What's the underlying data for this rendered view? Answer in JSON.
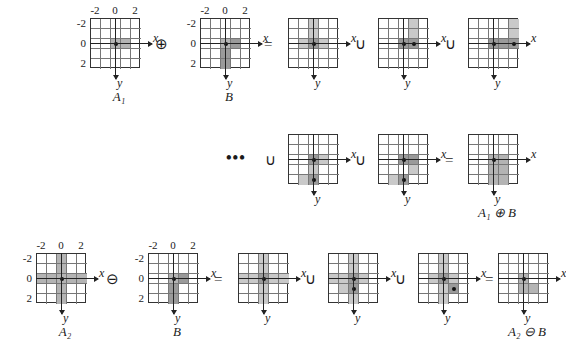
{
  "figure": {
    "axis_x_label": "x",
    "axis_y_label": "y",
    "tick_labels": [
      "-2",
      "0",
      "2"
    ],
    "ops": {
      "dilate": "⊕",
      "erode": "⊖",
      "union": "∪",
      "equals": "=",
      "ellipsis": "•••"
    },
    "captions": {
      "a1": "A",
      "a1_sub": "1",
      "b": "B",
      "a2": "A",
      "a2_sub": "2",
      "dilation_result": "A₁ ⊕ B",
      "erosion_result": "A₂ ⊖ B"
    }
  },
  "chart_data": {
    "type": "diagram",
    "grid_size": 5,
    "coordinate_range": [
      -2,
      2
    ],
    "origin_index": [
      2,
      2
    ],
    "row1": {
      "operands": [
        {
          "name": "A1",
          "caption": "A₁",
          "show_ticks": true,
          "origin_dot": true,
          "cells": [
            {
              "col": 2,
              "row": 2,
              "shade": "f"
            },
            {
              "col": 3,
              "row": 2,
              "shade": "f"
            }
          ]
        },
        {
          "name": "B",
          "caption": "B",
          "show_ticks": true,
          "origin_dot": true,
          "cells": [
            {
              "col": 2,
              "row": 2,
              "shade": "f"
            },
            {
              "col": 3,
              "row": 2,
              "shade": "fd"
            },
            {
              "col": 2,
              "row": 3,
              "shade": "fd"
            },
            {
              "col": 2,
              "row": 4,
              "shade": "fd"
            }
          ]
        }
      ],
      "terms": [
        {
          "name": "translate-m2-m2",
          "show_ticks": false,
          "dots": [
            {
              "col": 2,
              "row": 2
            }
          ],
          "cells": [
            {
              "col": 2,
              "row": 0,
              "shade": "fl"
            },
            {
              "col": 2,
              "row": 1,
              "shade": "fl"
            },
            {
              "col": 1,
              "row": 2,
              "shade": "fl"
            },
            {
              "col": 2,
              "row": 2,
              "shade": "fd"
            },
            {
              "col": 3,
              "row": 2,
              "shade": "fl"
            }
          ]
        },
        {
          "name": "translate-m1",
          "show_ticks": false,
          "dots": [
            {
              "col": 2,
              "row": 2
            },
            {
              "col": 3,
              "row": 2
            }
          ],
          "cells": [
            {
              "col": 3,
              "row": 0,
              "shade": "fl"
            },
            {
              "col": 3,
              "row": 1,
              "shade": "fl"
            },
            {
              "col": 2,
              "row": 2,
              "shade": "fd"
            },
            {
              "col": 3,
              "row": 2,
              "shade": "fd"
            }
          ]
        },
        {
          "name": "translate-0",
          "show_ticks": false,
          "dots": [
            {
              "col": 2,
              "row": 2
            },
            {
              "col": 4,
              "row": 2
            }
          ],
          "cells": [
            {
              "col": 4,
              "row": 0,
              "shade": "fl"
            },
            {
              "col": 4,
              "row": 1,
              "shade": "fl"
            },
            {
              "col": 2,
              "row": 2,
              "shade": "fd"
            },
            {
              "col": 3,
              "row": 2,
              "shade": "fd"
            },
            {
              "col": 4,
              "row": 2,
              "shade": "fd"
            }
          ]
        }
      ]
    },
    "row2": {
      "terms": [
        {
          "name": "translate-p1",
          "show_ticks": false,
          "dots": [
            {
              "col": 2,
              "row": 2
            },
            {
              "col": 2,
              "row": 4
            }
          ],
          "cells": [
            {
              "col": 2,
              "row": 2,
              "shade": "fd"
            },
            {
              "col": 3,
              "row": 2,
              "shade": "fl"
            },
            {
              "col": 2,
              "row": 3,
              "shade": "fl"
            },
            {
              "col": 1,
              "row": 4,
              "shade": "fl"
            },
            {
              "col": 2,
              "row": 4,
              "shade": "fd"
            }
          ]
        },
        {
          "name": "translate-p2",
          "show_ticks": false,
          "dots": [
            {
              "col": 2,
              "row": 2
            },
            {
              "col": 2,
              "row": 4
            }
          ],
          "cells": [
            {
              "col": 2,
              "row": 2,
              "shade": "fd"
            },
            {
              "col": 3,
              "row": 2,
              "shade": "fd"
            },
            {
              "col": 3,
              "row": 3,
              "shade": "fl"
            },
            {
              "col": 1,
              "row": 4,
              "shade": "fl"
            },
            {
              "col": 2,
              "row": 4,
              "shade": "fd"
            }
          ]
        }
      ],
      "result": {
        "name": "A1-dilate-B",
        "caption": "A₁ ⊕ B",
        "show_ticks": false,
        "dots": [
          {
            "col": 2,
            "row": 2
          }
        ],
        "cells": [
          {
            "col": 2,
            "row": 2,
            "shade": "f"
          },
          {
            "col": 3,
            "row": 2,
            "shade": "f"
          },
          {
            "col": 2,
            "row": 3,
            "shade": "f"
          },
          {
            "col": 3,
            "row": 3,
            "shade": "f"
          },
          {
            "col": 2,
            "row": 4,
            "shade": "f"
          },
          {
            "col": 3,
            "row": 4,
            "shade": "f"
          }
        ]
      }
    },
    "row3": {
      "operands": [
        {
          "name": "A2",
          "caption": "A₂",
          "show_ticks": true,
          "origin_dot": true,
          "cells": [
            {
              "col": 2,
              "row": 0,
              "shade": "f"
            },
            {
              "col": 2,
              "row": 1,
              "shade": "f"
            },
            {
              "col": 0,
              "row": 2,
              "shade": "f"
            },
            {
              "col": 1,
              "row": 2,
              "shade": "f"
            },
            {
              "col": 2,
              "row": 2,
              "shade": "f"
            },
            {
              "col": 3,
              "row": 2,
              "shade": "f"
            },
            {
              "col": 4,
              "row": 2,
              "shade": "f"
            },
            {
              "col": 2,
              "row": 3,
              "shade": "f"
            },
            {
              "col": 2,
              "row": 4,
              "shade": "f"
            }
          ]
        },
        {
          "name": "B",
          "caption": "B",
          "show_ticks": true,
          "origin_dot": true,
          "cells": [
            {
              "col": 2,
              "row": 2,
              "shade": "f"
            },
            {
              "col": 3,
              "row": 2,
              "shade": "fd"
            },
            {
              "col": 2,
              "row": 3,
              "shade": "fd"
            },
            {
              "col": 2,
              "row": 4,
              "shade": "fd"
            }
          ]
        }
      ],
      "terms": [
        {
          "name": "erode-term-1",
          "show_ticks": false,
          "dots": [
            {
              "col": 2,
              "row": 2
            }
          ],
          "cells": [
            {
              "col": 2,
              "row": 0,
              "shade": "fl"
            },
            {
              "col": 2,
              "row": 1,
              "shade": "fl"
            },
            {
              "col": 0,
              "row": 2,
              "shade": "fl"
            },
            {
              "col": 1,
              "row": 2,
              "shade": "fl"
            },
            {
              "col": 2,
              "row": 2,
              "shade": "fd"
            },
            {
              "col": 3,
              "row": 2,
              "shade": "fl"
            },
            {
              "col": 4,
              "row": 2,
              "shade": "fl"
            },
            {
              "col": 2,
              "row": 3,
              "shade": "fl"
            },
            {
              "col": 2,
              "row": 4,
              "shade": "fl"
            }
          ]
        },
        {
          "name": "erode-term-2",
          "show_ticks": false,
          "dots": [
            {
              "col": 2,
              "row": 2
            },
            {
              "col": 2,
              "row": 3
            }
          ],
          "cells": [
            {
              "col": 2,
              "row": 0,
              "shade": "fl"
            },
            {
              "col": 2,
              "row": 1,
              "shade": "fl"
            },
            {
              "col": 0,
              "row": 2,
              "shade": "fl"
            },
            {
              "col": 1,
              "row": 2,
              "shade": "fl"
            },
            {
              "col": 2,
              "row": 2,
              "shade": "fd"
            },
            {
              "col": 3,
              "row": 2,
              "shade": "fl"
            },
            {
              "col": 1,
              "row": 3,
              "shade": "fl"
            },
            {
              "col": 2,
              "row": 3,
              "shade": "fd"
            },
            {
              "col": 2,
              "row": 4,
              "shade": "fl"
            }
          ]
        },
        {
          "name": "erode-term-3",
          "show_ticks": false,
          "dots": [
            {
              "col": 2,
              "row": 2
            },
            {
              "col": 3,
              "row": 3
            }
          ],
          "cells": [
            {
              "col": 2,
              "row": 0,
              "shade": "fl"
            },
            {
              "col": 2,
              "row": 1,
              "shade": "fl"
            },
            {
              "col": 1,
              "row": 2,
              "shade": "fl"
            },
            {
              "col": 2,
              "row": 2,
              "shade": "fd"
            },
            {
              "col": 3,
              "row": 2,
              "shade": "fl"
            },
            {
              "col": 2,
              "row": 3,
              "shade": "fl"
            },
            {
              "col": 3,
              "row": 3,
              "shade": "fd"
            },
            {
              "col": 2,
              "row": 4,
              "shade": "fl"
            }
          ]
        }
      ],
      "result": {
        "name": "A2-erode-B",
        "caption": "A₂ ⊖ B",
        "show_ticks": false,
        "dots": [
          {
            "col": 2,
            "row": 2
          }
        ],
        "cells": [
          {
            "col": 2,
            "row": 2,
            "shade": "f"
          },
          {
            "col": 2,
            "row": 3,
            "shade": "f"
          },
          {
            "col": 3,
            "row": 3,
            "shade": "f"
          }
        ]
      }
    }
  }
}
